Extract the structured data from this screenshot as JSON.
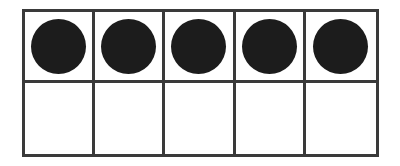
{
  "figure": {
    "name": "ten-frame",
    "description": "Ten frame with five filled counters",
    "rows": 2,
    "columns": 5,
    "total_cells": 10,
    "filled_count": 5,
    "empty_count": 5
  },
  "colors": {
    "background": "#ffffff",
    "grid_line": "#3a3a3a",
    "counter_fill": "#1c1c1c",
    "cell_fill": "#ffffff"
  },
  "cells": [
    {
      "row": 1,
      "column": 1,
      "filled": true,
      "counter_label": "counter"
    },
    {
      "row": 1,
      "column": 2,
      "filled": true,
      "counter_label": "counter"
    },
    {
      "row": 1,
      "column": 3,
      "filled": true,
      "counter_label": "counter"
    },
    {
      "row": 1,
      "column": 4,
      "filled": true,
      "counter_label": "counter"
    },
    {
      "row": 1,
      "column": 5,
      "filled": true,
      "counter_label": "counter"
    },
    {
      "row": 2,
      "column": 1,
      "filled": false,
      "counter_label": ""
    },
    {
      "row": 2,
      "column": 2,
      "filled": false,
      "counter_label": ""
    },
    {
      "row": 2,
      "column": 3,
      "filled": false,
      "counter_label": ""
    },
    {
      "row": 2,
      "column": 4,
      "filled": false,
      "counter_label": ""
    },
    {
      "row": 2,
      "column": 5,
      "filled": false,
      "counter_label": ""
    }
  ]
}
